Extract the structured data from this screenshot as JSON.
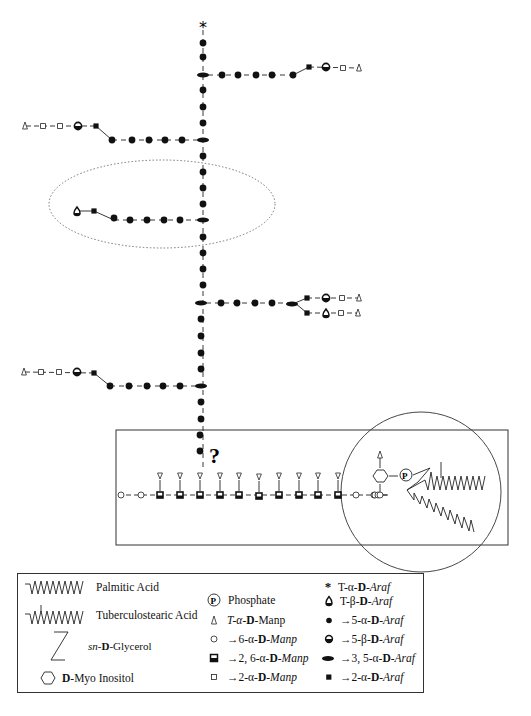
{
  "diagram": {
    "type": "glycan-structure",
    "annotations": {
      "top_terminal": "*",
      "unknown_linkage": "?",
      "phosphate_label": "P"
    },
    "arabinan_backbone": {
      "axis_x": 203,
      "units_top_to_bottom": [
        {
          "y": 27,
          "type": "T-alpha-Araf"
        },
        {
          "y": 43,
          "type": "5-alpha-Araf"
        },
        {
          "y": 57,
          "type": "5-alpha-Araf"
        },
        {
          "y": 75,
          "type": "3,5-alpha-Araf"
        },
        {
          "y": 90,
          "type": "5-alpha-Araf"
        },
        {
          "y": 107,
          "type": "5-alpha-Araf"
        },
        {
          "y": 123,
          "type": "5-alpha-Araf"
        },
        {
          "y": 140,
          "type": "3,5-alpha-Araf"
        },
        {
          "y": 156,
          "type": "5-alpha-Araf"
        },
        {
          "y": 172,
          "type": "5-alpha-Araf"
        },
        {
          "y": 188,
          "type": "5-alpha-Araf"
        },
        {
          "y": 204,
          "type": "5-alpha-Araf"
        },
        {
          "y": 220,
          "type": "3,5-alpha-Araf"
        },
        {
          "y": 237,
          "type": "5-alpha-Araf"
        },
        {
          "y": 253,
          "type": "5-alpha-Araf"
        },
        {
          "y": 269,
          "type": "5-alpha-Araf"
        },
        {
          "y": 285,
          "type": "5-alpha-Araf"
        },
        {
          "y": 303,
          "type": "3,5-alpha-Araf"
        },
        {
          "y": 319,
          "type": "5-alpha-Araf"
        },
        {
          "y": 335,
          "type": "5-alpha-Araf"
        },
        {
          "y": 351,
          "type": "5-alpha-Araf"
        },
        {
          "y": 367,
          "type": "5-alpha-Araf"
        },
        {
          "y": 386,
          "type": "3,5-alpha-Araf"
        },
        {
          "y": 402,
          "type": "5-alpha-Araf"
        },
        {
          "y": 418,
          "type": "5-alpha-Araf"
        },
        {
          "y": 435,
          "type": "5-alpha-Araf"
        },
        {
          "y": 451,
          "type": "5-alpha-Araf"
        }
      ]
    },
    "branches": [
      {
        "side": "right",
        "y": 75,
        "chain": [
          "5-alpha-Araf",
          "5-alpha-Araf",
          "5-alpha-Araf",
          "5-alpha-Araf",
          "5-alpha-Araf",
          "2-alpha-Araf",
          "5-beta-Araf",
          "2-alpha-Manp",
          "T-alpha-Manp"
        ]
      },
      {
        "side": "left",
        "y": 140,
        "chain": [
          "5-alpha-Araf",
          "5-alpha-Araf",
          "5-alpha-Araf",
          "5-alpha-Araf",
          "5-alpha-Araf",
          "2-alpha-Araf",
          "5-beta-Araf",
          "2-alpha-Manp",
          "2-alpha-Manp",
          "T-alpha-Manp"
        ]
      },
      {
        "side": "left",
        "y": 220,
        "circled": true,
        "chain": [
          "5-alpha-Araf",
          "5-alpha-Araf",
          "5-alpha-Araf",
          "5-alpha-Araf",
          "5-alpha-Araf",
          "2-alpha-Araf",
          "T-beta-Araf"
        ]
      },
      {
        "side": "right",
        "y": 303,
        "chain": [
          "5-alpha-Araf",
          "5-alpha-Araf",
          "5-alpha-Araf",
          "5-alpha-Araf",
          "3,5-alpha-Araf"
        ],
        "forks": [
          [
            "2-alpha-Araf",
            "5-beta-Araf",
            "2-alpha-Manp",
            "T-alpha-Manp"
          ],
          [
            "2-alpha-Araf",
            "T-beta-Araf",
            "2-alpha-Manp",
            "T-alpha-Manp"
          ]
        ]
      },
      {
        "side": "left",
        "y": 386,
        "chain": [
          "5-alpha-Araf",
          "5-alpha-Araf",
          "5-alpha-Araf",
          "5-alpha-Araf",
          "5-alpha-Araf",
          "2-alpha-Araf",
          "5-beta-Araf",
          "2-alpha-Manp",
          "2-alpha-Manp",
          "T-alpha-Manp"
        ]
      }
    ],
    "mannan_core": {
      "y": 493,
      "sequence": [
        "6-alpha-Manp",
        "6-alpha-Manp",
        "2,6-alpha-Manp",
        "2,6-alpha-Manp",
        "2,6-alpha-Manp",
        "2,6-alpha-Manp",
        "2,6-alpha-Manp",
        "2,6-alpha-Manp",
        "2,6-alpha-Manp",
        "2,6-alpha-Manp",
        "2,6-alpha-Manp",
        "2,6-alpha-Manp",
        "6-alpha-Manp",
        "6-alpha-Manp"
      ],
      "pendant_count": 10,
      "pendant_type": "T-alpha-Manp"
    },
    "anchor": {
      "components": [
        "D-Myo Inositol",
        "Phosphate",
        "sn-D-Glycerol",
        "Palmitic Acid",
        "Tuberculostearic Acid"
      ],
      "inositol_substituent": "T-alpha-Manp"
    }
  },
  "legend": {
    "col1": [
      {
        "symbol": "palmitic-zigzag",
        "label": "Palmitic Acid"
      },
      {
        "symbol": "tuberculostearic-zigzag",
        "label": "Tuberculostearic Acid"
      },
      {
        "symbol": "glycerol-z",
        "label_prefix": "sn-",
        "label_bold": "D",
        "label_rest": "-Glycerol"
      },
      {
        "symbol": "hexagon",
        "label_bold": "D",
        "label_rest": "-Myo Inositol"
      }
    ],
    "col2": [
      {
        "symbol": "P",
        "label": "Phosphate"
      },
      {
        "symbol": "∆",
        "label": "T-α-D-Manp"
      },
      {
        "symbol": "○",
        "label": "→6-α-D-Manp"
      },
      {
        "symbol": "◘",
        "label": "→2, 6-α-D-Manp"
      },
      {
        "symbol": "□",
        "label": "→2-α-D-Manp"
      }
    ],
    "col3": [
      {
        "symbol": "*",
        "label": "T-α-D-Araf"
      },
      {
        "symbol": "drop",
        "label": "T-β-D-Araf"
      },
      {
        "symbol": "●",
        "label": "→5-α-D-Araf"
      },
      {
        "symbol": "half-circle",
        "label": "→5-β-D-Araf"
      },
      {
        "symbol": "ellipse",
        "label": "→3, 5-α-D-Araf"
      },
      {
        "symbol": "■",
        "label": "→2-α-D-Araf"
      }
    ]
  },
  "text": {
    "star": "*",
    "question": "?",
    "phosphate": "P",
    "legend_palmitic": "Palmitic Acid",
    "legend_tbsa": "Tuberculostearic Acid",
    "legend_glycerol_prefix": "sn-",
    "legend_glycerol_d": "D",
    "legend_glycerol_rest": "-Glycerol",
    "legend_inositol_d": "D",
    "legend_inositol_rest": "-Myo Inositol",
    "legend_phosphate": "Phosphate",
    "legend_t_man_pre": "T-α-",
    "legend_t_man_d": "D",
    "legend_t_man_rest": "-Manp",
    "legend_6man_pre": "→6-α-",
    "legend_6man_d": "D",
    "legend_6man_rest": "-Manp",
    "legend_26man_pre": "→2, 6-α-",
    "legend_26man_d": "D",
    "legend_26man_rest": "-Manp",
    "legend_2man_pre": "→2-α-",
    "legend_2man_d": "D",
    "legend_2man_rest": "-Manp",
    "legend_ta_ara_pre": "T-α-",
    "legend_ta_ara_d": "D",
    "legend_ta_ara_rest": "-Araf",
    "legend_tb_ara_pre": "T-β-",
    "legend_tb_ara_d": "D",
    "legend_tb_ara_rest": "-Araf",
    "legend_5a_ara_pre": "→5-α-",
    "legend_5a_ara_d": "D",
    "legend_5a_ara_rest": "-Araf",
    "legend_5b_ara_pre": "→5-β-",
    "legend_5b_ara_d": "D",
    "legend_5b_ara_rest": "-Araf",
    "legend_35_ara_pre": "→3, 5-α-",
    "legend_35_ara_d": "D",
    "legend_35_ara_rest": "-Araf",
    "legend_2a_ara_pre": "→2-α-",
    "legend_2a_ara_d": "D",
    "legend_2a_ara_rest": "-Araf"
  }
}
